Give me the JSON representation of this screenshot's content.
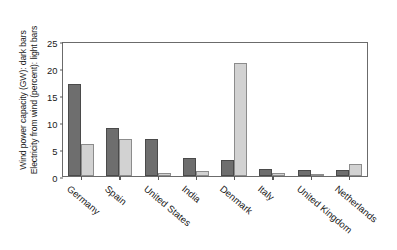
{
  "chart_data": {
    "type": "bar",
    "title": "",
    "xlabel": "",
    "ylabel_line1": "Wind power capacity (GW): dark bars",
    "ylabel_line2": "Electricity from wind (percent): light bars",
    "categories": [
      "Germany",
      "Spain",
      "United States",
      "India",
      "Denmark",
      "Italy",
      "United Kingdom",
      "Netherlands"
    ],
    "series": [
      {
        "name": "Wind power capacity (GW): dark bars",
        "key": "dark",
        "color": "#6e6e6e",
        "values": [
          17.0,
          8.8,
          6.8,
          3.4,
          2.9,
          1.3,
          1.1,
          1.1
        ]
      },
      {
        "name": "Electricity from wind (percent): light bars",
        "key": "light",
        "color": "#d2d2d2",
        "values": [
          6.0,
          6.8,
          0.5,
          0.9,
          20.9,
          0.5,
          0.35,
          2.3
        ]
      }
    ],
    "ylim": [
      0,
      25
    ],
    "yticks": [
      0,
      5,
      10,
      15,
      20,
      25
    ],
    "ytick_labels": [
      "0",
      "5",
      "10",
      "15",
      "20",
      "25"
    ],
    "grid": false,
    "legend_position": "none"
  },
  "colors": {
    "dark_bar": "#6e6e6e",
    "dark_bar_edge": "#4a4a4a",
    "light_bar": "#d2d2d2",
    "light_bar_edge": "#8c8c8c",
    "frame": "#6b6b6b",
    "background": "#ffffff",
    "text": "#1a1a1a"
  }
}
